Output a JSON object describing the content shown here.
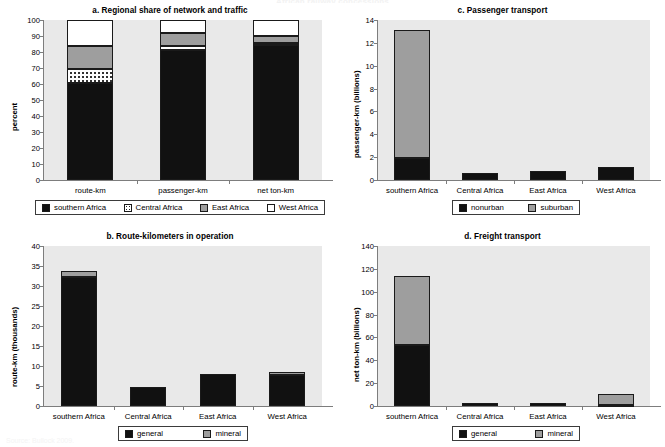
{
  "page": {
    "top_cut_title": "African railway concessions",
    "bottom_cut_source": "Source: Bullock 2009."
  },
  "colors": {
    "black": "#111111",
    "gray": "#9e9e9e",
    "white": "#ffffff",
    "dotted": "#ffffff",
    "plot_background": "#e9e9e9",
    "axis": "#7d7d7d"
  },
  "charts": [
    {
      "id": "a",
      "title": "a. Regional share of network and traffic",
      "ylabel": "percent",
      "xlabel": "",
      "yticks": [
        "0",
        "10",
        "20",
        "30",
        "40",
        "50",
        "60",
        "70",
        "80",
        "90",
        "100"
      ],
      "ylim": [
        0,
        100
      ],
      "categories": [
        "route-km",
        "passenger-km",
        "net ton-km"
      ],
      "legend": [
        {
          "label": "southern Africa",
          "fill": "black"
        },
        {
          "label": "Central Africa",
          "fill": "dots"
        },
        {
          "label": "East Africa",
          "fill": "gray"
        },
        {
          "label": "West Africa",
          "fill": "white"
        }
      ],
      "series": [
        {
          "name": "southern Africa",
          "fill": "black",
          "values": [
            60.5,
            81.5,
            84.5
          ]
        },
        {
          "name": "Central Africa",
          "fill": "dots",
          "values": [
            9.0,
            2.0,
            1.0
          ]
        },
        {
          "name": "East Africa",
          "fill": "gray",
          "values": [
            14.5,
            8.5,
            4.5
          ]
        },
        {
          "name": "West Africa",
          "fill": "white",
          "values": [
            16.0,
            8.0,
            10.0
          ]
        }
      ]
    },
    {
      "id": "b",
      "title": "b. Route-kilometers in operation",
      "ylabel": "route-km (thousands)",
      "xlabel": "",
      "yticks": [
        "0",
        "5",
        "10",
        "15",
        "20",
        "25",
        "30",
        "35",
        "40"
      ],
      "ylim": [
        0,
        40
      ],
      "categories": [
        "southern Africa",
        "Central Africa",
        "East Africa",
        "West Africa"
      ],
      "legend": [
        {
          "label": "general",
          "fill": "black"
        },
        {
          "label": "mineral",
          "fill": "gray"
        }
      ],
      "series": [
        {
          "name": "general",
          "fill": "black",
          "values": [
            32.3,
            4.7,
            7.9,
            7.8
          ]
        },
        {
          "name": "mineral",
          "fill": "gray",
          "values": [
            1.4,
            0.0,
            0.0,
            0.7
          ]
        }
      ]
    },
    {
      "id": "c",
      "title": "c. Passenger transport",
      "ylabel": "passenger-km (billions)",
      "xlabel": "",
      "yticks": [
        "0",
        "2",
        "4",
        "6",
        "8",
        "10",
        "12",
        "14"
      ],
      "ylim": [
        0,
        14
      ],
      "categories": [
        "southern Africa",
        "Central Africa",
        "East Africa",
        "West Africa"
      ],
      "legend": [
        {
          "label": "nonurban",
          "fill": "black"
        },
        {
          "label": "suburban",
          "fill": "gray"
        }
      ],
      "series": [
        {
          "name": "nonurban",
          "fill": "black",
          "values": [
            1.95,
            0.6,
            0.75,
            1.1
          ]
        },
        {
          "name": "suburban",
          "fill": "gray",
          "values": [
            11.2,
            0.0,
            0.0,
            0.0
          ]
        }
      ]
    },
    {
      "id": "d",
      "title": "d. Freight transport",
      "ylabel": "net ton-km (billions)",
      "xlabel": "",
      "yticks": [
        "0",
        "20",
        "40",
        "60",
        "80",
        "100",
        "120",
        "140"
      ],
      "ylim": [
        0,
        140
      ],
      "categories": [
        "southern Africa",
        "Central Africa",
        "East Africa",
        "West Africa"
      ],
      "legend": [
        {
          "label": "general",
          "fill": "black"
        },
        {
          "label": "mineral",
          "fill": "gray"
        }
      ],
      "series": [
        {
          "name": "general",
          "fill": "black",
          "values": [
            53.0,
            2.3,
            2.4,
            0.8
          ]
        },
        {
          "name": "mineral",
          "fill": "gray",
          "values": [
            61.0,
            0.3,
            0.2,
            9.8
          ]
        }
      ]
    }
  ],
  "chart_data": {
    "type": "bar",
    "layout": "2x2 panel of stacked bar charts",
    "panels": [
      {
        "panel": "a",
        "title": "a. Regional share of network and traffic",
        "ylabel": "percent",
        "ylim": [
          0,
          100
        ],
        "categories": [
          "route-km",
          "passenger-km",
          "net ton-km"
        ],
        "stacked": true,
        "series": [
          {
            "name": "southern Africa",
            "values": [
              60.5,
              81.5,
              84.5
            ]
          },
          {
            "name": "Central Africa",
            "values": [
              9.0,
              2.0,
              1.0
            ]
          },
          {
            "name": "East Africa",
            "values": [
              14.5,
              8.5,
              4.5
            ]
          },
          {
            "name": "West Africa",
            "values": [
              16.0,
              8.0,
              10.0
            ]
          }
        ],
        "legend_position": "below"
      },
      {
        "panel": "b",
        "title": "b. Route-kilometers in operation",
        "ylabel": "route-km (thousands)",
        "ylim": [
          0,
          40
        ],
        "categories": [
          "southern Africa",
          "Central Africa",
          "East Africa",
          "West Africa"
        ],
        "stacked": true,
        "series": [
          {
            "name": "general",
            "values": [
              32.3,
              4.7,
              7.9,
              7.8
            ]
          },
          {
            "name": "mineral",
            "values": [
              1.4,
              0.0,
              0.0,
              0.7
            ]
          }
        ],
        "legend_position": "below"
      },
      {
        "panel": "c",
        "title": "c. Passenger transport",
        "ylabel": "passenger-km (billions)",
        "ylim": [
          0,
          14
        ],
        "categories": [
          "southern Africa",
          "Central Africa",
          "East Africa",
          "West Africa"
        ],
        "stacked": true,
        "series": [
          {
            "name": "nonurban",
            "values": [
              1.95,
              0.6,
              0.75,
              1.1
            ]
          },
          {
            "name": "suburban",
            "values": [
              11.2,
              0.0,
              0.0,
              0.0
            ]
          }
        ],
        "legend_position": "below"
      },
      {
        "panel": "d",
        "title": "d. Freight transport",
        "ylabel": "net ton-km (billions)",
        "ylim": [
          0,
          140
        ],
        "categories": [
          "southern Africa",
          "Central Africa",
          "East Africa",
          "West Africa"
        ],
        "stacked": true,
        "series": [
          {
            "name": "general",
            "values": [
              53.0,
              2.3,
              2.4,
              0.8
            ]
          },
          {
            "name": "mineral",
            "values": [
              61.0,
              0.3,
              0.2,
              9.8
            ]
          }
        ],
        "legend_position": "below"
      }
    ],
    "grid": false
  }
}
